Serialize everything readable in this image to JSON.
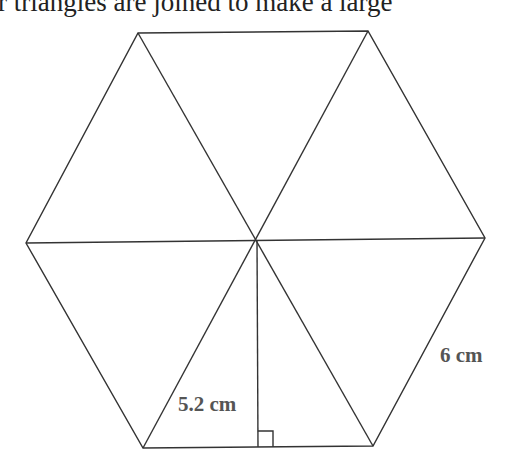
{
  "caption": {
    "text": "r triangles are joined to make a large"
  },
  "figure": {
    "shape": "regular hexagon divided into 6 equilateral triangles",
    "vertices": {
      "top_left": [
        138,
        33
      ],
      "top_right": [
        368,
        31
      ],
      "right": [
        485,
        238
      ],
      "bottom_right": [
        373,
        446
      ],
      "bottom_left": [
        143,
        448
      ],
      "left": [
        26,
        243
      ],
      "center": [
        256,
        240
      ]
    },
    "height_foot": [
      258,
      447
    ],
    "stroke_color": "#333333",
    "label_color": "#555555"
  },
  "labels": {
    "height": "5.2 cm",
    "side": "6 cm"
  }
}
